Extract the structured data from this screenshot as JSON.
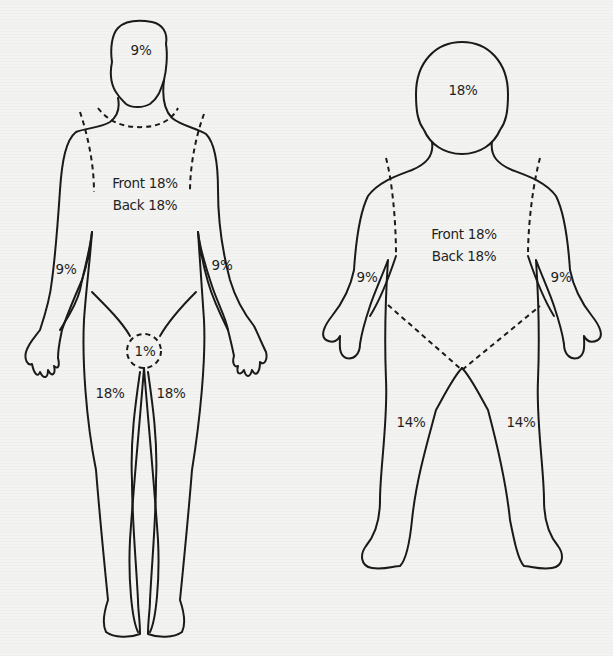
{
  "figure": {
    "colors": {
      "line": "#1a1a1a",
      "text": "#1f1f1f",
      "paper": "#f4f4f2"
    }
  },
  "adult": {
    "head": "9%",
    "trunk_front": "Front 18%",
    "trunk_back": "Back 18%",
    "arm_right": "9%",
    "arm_left": "9%",
    "perineum": "1%",
    "leg_right": "18%",
    "leg_left": "18%"
  },
  "child": {
    "head": "18%",
    "trunk_front": "Front 18%",
    "trunk_back": "Back 18%",
    "arm_right": "9%",
    "arm_left": "9%",
    "leg_right": "14%",
    "leg_left": "14%"
  }
}
